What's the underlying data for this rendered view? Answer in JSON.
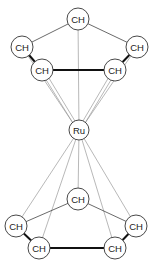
{
  "diagram": {
    "title": "",
    "metal": {
      "label": "Ru",
      "x": 79,
      "y": 130,
      "r": 10
    },
    "top_ring": {
      "nodes": [
        {
          "label": "CH",
          "x": 78,
          "y": 19
        },
        {
          "label": "CH",
          "x": 22,
          "y": 47
        },
        {
          "label": "CH",
          "x": 42,
          "y": 70
        },
        {
          "label": "CH",
          "x": 115,
          "y": 70
        },
        {
          "label": "CH",
          "x": 137,
          "y": 47
        }
      ]
    },
    "bottom_ring": {
      "nodes": [
        {
          "label": "CH",
          "x": 78,
          "y": 199
        },
        {
          "label": "CH",
          "x": 16,
          "y": 226
        },
        {
          "label": "CH",
          "x": 39,
          "y": 248
        },
        {
          "label": "CH",
          "x": 115,
          "y": 248
        },
        {
          "label": "CH",
          "x": 136,
          "y": 226
        }
      ]
    },
    "node_radius": 11
  }
}
